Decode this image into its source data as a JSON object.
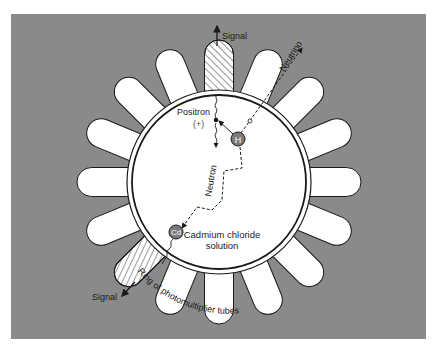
{
  "diagram": {
    "colors": {
      "panel": "#8a8a8a",
      "tube": "#ffffff",
      "outline": "#1a1a1a",
      "particle_fill": "#7a7a7a",
      "page": "#ffffff"
    },
    "labels": {
      "signal_top": "Signal",
      "signal_bottom": "Signal",
      "neutrino": "Neutrino",
      "positron": "Positron",
      "positron_charge": "(+)",
      "neutron": "Neutron",
      "hydrogen": "H",
      "cadmium": "Cd",
      "solution_line1": "Cadmium chloride",
      "solution_line2": "solution",
      "ring": "Ring of photomultiplier tubes"
    },
    "tube_count": 16,
    "hatched_tube_angles_deg": [
      -90,
      135
    ]
  }
}
